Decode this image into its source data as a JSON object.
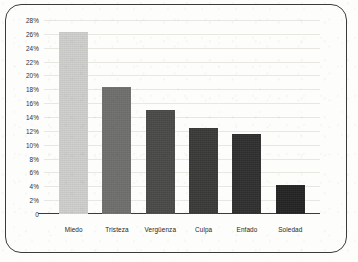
{
  "chart_data": {
    "type": "bar",
    "title": "",
    "subtitle": "",
    "xlabel": "",
    "ylabel": "",
    "ylim": [
      0,
      28
    ],
    "grid": true,
    "legend": "none",
    "categories": [
      "Miedo",
      "Tristeza",
      "Vergüenza",
      "Culpa",
      "Enfado",
      "Soledad"
    ],
    "values": [
      26.2,
      18.3,
      15.0,
      12.4,
      11.5,
      4.2
    ],
    "value_unit": "%",
    "ytick_labels": [
      "28%",
      "26%",
      "24%",
      "22%",
      "20%",
      "18%",
      "16%",
      "14%",
      "12%",
      "10%",
      "8%",
      "6%",
      "4%",
      "2%",
      "0"
    ],
    "ytick_values": [
      28,
      26,
      24,
      22,
      20,
      18,
      16,
      14,
      12,
      10,
      8,
      6,
      4,
      2,
      0
    ],
    "bar_colors": [
      "#cfcfcd",
      "#6f6f6e",
      "#4a4a49",
      "#3a3a39",
      "#303030",
      "#242424"
    ],
    "bars": [
      {
        "category": "Miedo",
        "value": 26.2,
        "color": "#cfcfcd"
      },
      {
        "category": "Tristeza",
        "value": 18.3,
        "color": "#6f6f6e"
      },
      {
        "category": "Vergüenza",
        "value": 15.0,
        "color": "#4a4a49"
      },
      {
        "category": "Culpa",
        "value": 12.4,
        "color": "#3a3a39"
      },
      {
        "category": "Enfado",
        "value": 11.5,
        "color": "#303030"
      },
      {
        "category": "Soledad",
        "value": 4.2,
        "color": "#242424"
      }
    ]
  },
  "frame": {
    "border_color": "#3b3b3b",
    "axis_color": "#3a3a3a",
    "gridline_color": "#e9e7e2",
    "background": "#fdfdfc",
    "tick_text_color": "#2e2e2e"
  }
}
